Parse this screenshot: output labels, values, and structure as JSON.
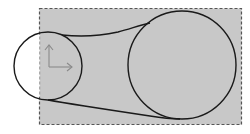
{
  "diagram": {
    "type": "belt-pulley-bounding-box",
    "colors": {
      "background": "#ffffff",
      "box_fill": "#c8c8c8",
      "box_border": "#555555",
      "stroke": "#1a1a1a",
      "axes": "#8a8a8a"
    },
    "bounding_box": {
      "x": 39,
      "y": 8,
      "width": 202,
      "height": 116,
      "style": "dashed"
    },
    "small_circle": {
      "cx": 48,
      "cy": 66,
      "r": 34
    },
    "large_circle": {
      "cx": 182,
      "cy": 65,
      "r": 54
    },
    "axes": {
      "origin": {
        "x": 49,
        "y": 67
      },
      "y_axis_end": {
        "x": 49,
        "y": 44
      },
      "x_axis_end": {
        "x": 72,
        "y": 67
      }
    }
  }
}
